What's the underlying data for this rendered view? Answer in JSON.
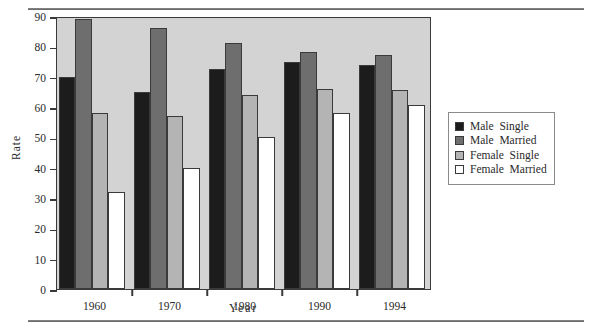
{
  "figure": {
    "plot_background": "#d3d3d3",
    "rules": [
      "top-horizontal-rule",
      "bottom-horizontal-rule"
    ]
  },
  "legend": {
    "position": "right",
    "entries": [
      {
        "label": "Male  Single",
        "color": "#1c1c1c"
      },
      {
        "label": "Male  Married",
        "color": "#6e6e6e"
      },
      {
        "label": "Female  Single",
        "color": "#b4b4b4"
      },
      {
        "label": "Female  Married",
        "color": "#ffffff"
      }
    ]
  },
  "chart_data": {
    "type": "bar",
    "title": "",
    "xlabel": "Year",
    "ylabel": "Rate",
    "categories": [
      "1960",
      "1970",
      "1980",
      "1990",
      "1994"
    ],
    "series": [
      {
        "name": "Male  Single",
        "color": "#1c1c1c",
        "values": [
          70,
          65,
          72.5,
          75,
          74
        ]
      },
      {
        "name": "Male  Married",
        "color": "#6e6e6e",
        "values": [
          89,
          86,
          81,
          78,
          77
        ]
      },
      {
        "name": "Female  Single",
        "color": "#b4b4b4",
        "values": [
          58,
          57,
          64,
          66,
          65.5
        ]
      },
      {
        "name": "Female  Married",
        "color": "#ffffff",
        "values": [
          32,
          40,
          50,
          58,
          60.5
        ]
      }
    ],
    "ylim": [
      0,
      90
    ],
    "yticks": [
      0,
      10,
      20,
      30,
      40,
      50,
      60,
      70,
      80,
      90
    ],
    "ytick_labels": [
      "0",
      "10",
      "20",
      "30",
      "40",
      "50",
      "60",
      "70",
      "80",
      "90"
    ],
    "grid": false,
    "legend_position": "right"
  }
}
